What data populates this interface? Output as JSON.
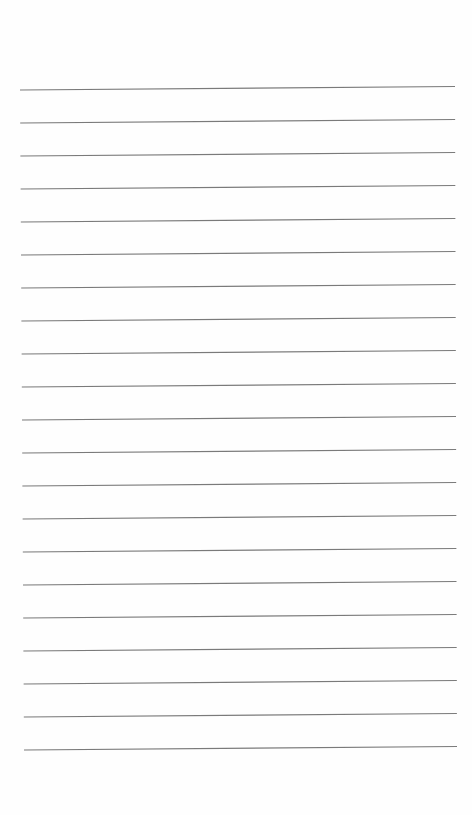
{
  "page": {
    "type": "blank lined paper",
    "background": "#fefefe",
    "line_color": "#7a7a7a",
    "line_count": 21,
    "first_line_left_y": 90,
    "line_spacing": 33,
    "left_x_start": 20,
    "left_x_end": 24,
    "right_x_start": 455,
    "right_x_end": 457,
    "right_rise": 3.5
  }
}
